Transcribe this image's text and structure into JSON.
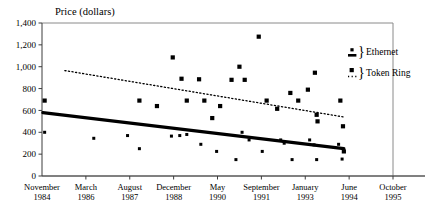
{
  "chart_data": {
    "type": "scatter",
    "title": "Price (dollars)",
    "xlabel": "",
    "ylabel": "Price (dollars)",
    "ylim": [
      0,
      1400
    ],
    "ytick_values": [
      0,
      200,
      400,
      600,
      800,
      1000,
      1200,
      1400
    ],
    "ytick_labels": [
      "0",
      "200",
      "400",
      "600",
      "800",
      "1,000",
      "1,200",
      "1,400"
    ],
    "xtick_labels": [
      {
        "month": "November",
        "year": "1984"
      },
      {
        "month": "March",
        "year": "1986"
      },
      {
        "month": "August",
        "year": "1987"
      },
      {
        "month": "December",
        "year": "1988"
      },
      {
        "month": "May",
        "year": "1990"
      },
      {
        "month": "September",
        "year": "1991"
      },
      {
        "month": "January",
        "year": "1993"
      },
      {
        "month": "June",
        "year": "1994"
      },
      {
        "month": "October",
        "year": "1995"
      }
    ],
    "grid": false,
    "legend_position": "top-right",
    "series": [
      {
        "name": "Ethernet",
        "marker": "small-square",
        "line_style": "solid-thick",
        "points": [
          {
            "x": 1.06,
            "y": 400
          },
          {
            "x": 2.18,
            "y": 345
          },
          {
            "x": 2.95,
            "y": 370
          },
          {
            "x": 3.22,
            "y": 250
          },
          {
            "x": 3.95,
            "y": 365
          },
          {
            "x": 4.14,
            "y": 370
          },
          {
            "x": 4.3,
            "y": 380
          },
          {
            "x": 4.62,
            "y": 290
          },
          {
            "x": 4.98,
            "y": 225
          },
          {
            "x": 5.42,
            "y": 150
          },
          {
            "x": 5.56,
            "y": 400
          },
          {
            "x": 5.72,
            "y": 330
          },
          {
            "x": 6.02,
            "y": 225
          },
          {
            "x": 6.44,
            "y": 330
          },
          {
            "x": 6.52,
            "y": 300
          },
          {
            "x": 6.7,
            "y": 150
          },
          {
            "x": 7.1,
            "y": 330
          },
          {
            "x": 7.2,
            "y": 285
          },
          {
            "x": 7.26,
            "y": 150
          },
          {
            "x": 7.76,
            "y": 290
          },
          {
            "x": 7.84,
            "y": 155
          }
        ],
        "trend": {
          "x0": 1.02,
          "y0": 580,
          "x1": 7.88,
          "y1": 250
        }
      },
      {
        "name": "Token Ring",
        "marker": "square",
        "line_style": "dotted",
        "points": [
          {
            "x": 1.06,
            "y": 690
          },
          {
            "x": 3.22,
            "y": 690
          },
          {
            "x": 3.62,
            "y": 640
          },
          {
            "x": 3.98,
            "y": 1085
          },
          {
            "x": 4.18,
            "y": 890
          },
          {
            "x": 4.3,
            "y": 690
          },
          {
            "x": 4.58,
            "y": 885
          },
          {
            "x": 4.7,
            "y": 690
          },
          {
            "x": 4.88,
            "y": 530
          },
          {
            "x": 5.06,
            "y": 640
          },
          {
            "x": 5.32,
            "y": 880
          },
          {
            "x": 5.5,
            "y": 1000
          },
          {
            "x": 5.62,
            "y": 880
          },
          {
            "x": 5.94,
            "y": 1275
          },
          {
            "x": 6.12,
            "y": 690
          },
          {
            "x": 6.36,
            "y": 615
          },
          {
            "x": 6.66,
            "y": 760
          },
          {
            "x": 6.84,
            "y": 690
          },
          {
            "x": 7.06,
            "y": 790
          },
          {
            "x": 7.22,
            "y": 945
          },
          {
            "x": 7.26,
            "y": 560
          },
          {
            "x": 7.28,
            "y": 500
          },
          {
            "x": 7.8,
            "y": 690
          },
          {
            "x": 7.86,
            "y": 455
          },
          {
            "x": 7.88,
            "y": 225
          }
        ],
        "trend": {
          "x0": 1.52,
          "y0": 965,
          "x1": 7.88,
          "y1": 540
        }
      }
    ]
  },
  "legend": {
    "items": [
      {
        "label": "Ethernet",
        "brace": "}"
      },
      {
        "label": "Token Ring",
        "brace": "}"
      }
    ]
  },
  "colors": {
    "marker": "#000000",
    "axis": "#3c3c3c",
    "frame": "#8a8a8a",
    "background": "#ffffff"
  }
}
